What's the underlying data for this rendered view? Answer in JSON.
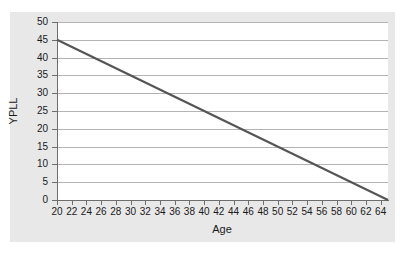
{
  "chart_data": {
    "type": "line",
    "title": "",
    "xlabel": "Age",
    "ylabel": "YPLL",
    "xlim": [
      20,
      65
    ],
    "ylim": [
      0,
      50
    ],
    "grid": true,
    "legend": false,
    "x_tick_labels": [
      "20",
      "22",
      "24",
      "26",
      "28",
      "30",
      "32",
      "34",
      "36",
      "38",
      "40",
      "42",
      "44",
      "46",
      "48",
      "50",
      "52",
      "54",
      "56",
      "58",
      "60",
      "62",
      "64"
    ],
    "x_ticks": [
      20,
      22,
      24,
      26,
      28,
      30,
      32,
      34,
      36,
      38,
      40,
      42,
      44,
      46,
      48,
      50,
      52,
      54,
      56,
      58,
      60,
      62,
      64
    ],
    "y_tick_labels": [
      "0",
      "5",
      "10",
      "15",
      "20",
      "25",
      "30",
      "35",
      "40",
      "45",
      "50"
    ],
    "y_ticks": [
      0,
      5,
      10,
      15,
      20,
      25,
      30,
      35,
      40,
      45,
      50
    ],
    "series": [
      {
        "name": "YPLL",
        "color": "#555555",
        "x": [
          20,
          65
        ],
        "values": [
          45,
          0
        ]
      }
    ],
    "annotations": []
  },
  "style": {
    "panel_background": "#e8e8e8",
    "plot_background": "#ffffff",
    "gridline_color": "#b4b4b4",
    "axis_color": "#6e6e6e",
    "text_color": "#1a1a1a",
    "line_color": "#555555"
  }
}
